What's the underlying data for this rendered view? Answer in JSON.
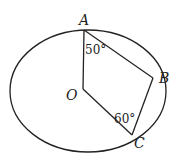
{
  "diagram": {
    "labels": {
      "A": "A",
      "B": "B",
      "C": "C",
      "O": "O"
    },
    "angles": {
      "OAB": "50°",
      "OCB": "60°"
    },
    "colors": {
      "stroke": "#222222",
      "background": "#ffffff"
    }
  }
}
